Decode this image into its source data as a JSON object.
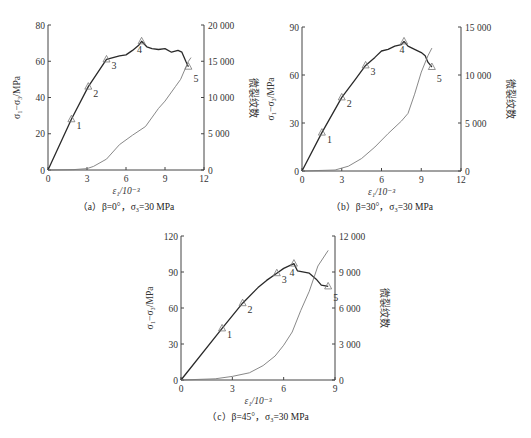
{
  "chart_data": [
    {
      "id": "a",
      "type": "line",
      "title": "(a) β=0°，σ3=30 MPa",
      "xlabel": "ε1/10⁻³",
      "ylabel": "σ1−σ3/MPa",
      "y2label": "微裂纹数",
      "xlim": [
        0,
        12
      ],
      "ylim": [
        0,
        80
      ],
      "y2lim": [
        0,
        20000
      ],
      "xticks": [
        "0",
        "3",
        "6",
        "9",
        "12"
      ],
      "yticks": [
        "0",
        "20",
        "40",
        "60",
        "80"
      ],
      "y2ticks": [
        "0",
        "5 000",
        "10 000",
        "15 000",
        "20 000"
      ],
      "grid": false,
      "series": [
        {
          "name": "stress",
          "axis": "left",
          "x": [
            0,
            1.8,
            3.1,
            4.5,
            5.0,
            5.5,
            6.0,
            6.5,
            7.0,
            7.2,
            7.6,
            8.0,
            8.5,
            9.0,
            9.5,
            10.0,
            10.3,
            10.6,
            10.8
          ],
          "y": [
            0,
            28,
            46,
            61,
            62,
            63,
            63.5,
            66,
            69,
            71,
            68,
            67,
            66.5,
            67,
            65,
            66,
            65,
            60,
            57
          ]
        },
        {
          "name": "micro-cracks",
          "axis": "right",
          "x": [
            0,
            2.0,
            3.0,
            3.5,
            4.5,
            5.5,
            6.5,
            7.5,
            8.5,
            9.0,
            9.8,
            10.2,
            10.8,
            11.0
          ],
          "y": [
            0,
            50,
            200,
            500,
            1500,
            3500,
            4800,
            6000,
            8500,
            9500,
            11500,
            12500,
            15000,
            15500
          ]
        }
      ],
      "points": [
        {
          "label": "1",
          "x": 1.8,
          "y": 28
        },
        {
          "label": "2",
          "x": 3.1,
          "y": 46
        },
        {
          "label": "3",
          "x": 4.5,
          "y": 61
        },
        {
          "label": "4",
          "x": 7.2,
          "y": 71
        },
        {
          "label": "5",
          "x": 10.8,
          "y": 57
        }
      ]
    },
    {
      "id": "b",
      "type": "line",
      "title": "(b) β=30°，σ3=30 MPa",
      "xlabel": "ε1/10⁻³",
      "ylabel": "σ1−σ3/MPa",
      "y2label": "微裂纹数",
      "xlim": [
        0,
        12
      ],
      "ylim": [
        0,
        90
      ],
      "y2lim": [
        0,
        15000
      ],
      "xticks": [
        "0",
        "3",
        "6",
        "9",
        "12"
      ],
      "yticks": [
        "0",
        "30",
        "60",
        "90"
      ],
      "y2ticks": [
        "0",
        "5 000",
        "10 000",
        "15 000"
      ],
      "grid": false,
      "series": [
        {
          "name": "stress",
          "axis": "left",
          "x": [
            0,
            1.5,
            3.0,
            4.0,
            4.8,
            5.5,
            6.0,
            6.5,
            7.0,
            7.5,
            7.7,
            8.0,
            8.5,
            9.0,
            9.3,
            9.5,
            9.8
          ],
          "y": [
            0,
            24,
            46,
            57,
            66,
            71,
            75,
            76,
            78,
            79,
            81,
            78,
            76,
            74,
            72,
            68,
            65
          ]
        },
        {
          "name": "micro-cracks",
          "axis": "right",
          "x": [
            0,
            2.5,
            3.5,
            4.5,
            5.5,
            6.5,
            7.5,
            8.0,
            8.5,
            9.0,
            9.5,
            9.8
          ],
          "y": [
            0,
            100,
            500,
            1300,
            2500,
            3900,
            5200,
            6000,
            8000,
            10300,
            12000,
            12800
          ]
        }
      ],
      "points": [
        {
          "label": "1",
          "x": 1.5,
          "y": 24
        },
        {
          "label": "2",
          "x": 3.0,
          "y": 46
        },
        {
          "label": "3",
          "x": 4.8,
          "y": 66
        },
        {
          "label": "4",
          "x": 7.7,
          "y": 81
        },
        {
          "label": "5",
          "x": 9.8,
          "y": 65
        }
      ]
    },
    {
      "id": "c",
      "type": "line",
      "title": "(c) β=45°，σ3=30 MPa",
      "xlabel": "ε1/10⁻³",
      "ylabel": "σ1−σ3/MPa",
      "y2label": "微裂纹数",
      "xlim": [
        0,
        9
      ],
      "ylim": [
        0,
        120
      ],
      "y2lim": [
        0,
        12000
      ],
      "xticks": [
        "0",
        "3",
        "6",
        "9"
      ],
      "yticks": [
        "0",
        "30",
        "60",
        "90",
        "120"
      ],
      "y2ticks": [
        "0",
        "3 000",
        "6 000",
        "9 000",
        "12 000"
      ],
      "grid": false,
      "series": [
        {
          "name": "stress",
          "axis": "left",
          "x": [
            0,
            2.4,
            3.6,
            4.5,
            5.0,
            5.6,
            6.0,
            6.6,
            6.8,
            7.5,
            7.9,
            8.2,
            8.6
          ],
          "y": [
            0,
            43,
            64,
            77,
            83,
            89,
            93,
            97,
            91,
            89,
            84,
            79,
            78
          ]
        },
        {
          "name": "micro-cracks",
          "axis": "right",
          "x": [
            0,
            2.0,
            3.0,
            4.0,
            4.8,
            5.5,
            6.0,
            6.5,
            7.0,
            7.5,
            8.0,
            8.6
          ],
          "y": [
            0,
            100,
            300,
            600,
            1200,
            2000,
            2900,
            4000,
            5800,
            7400,
            9500,
            10800
          ]
        }
      ],
      "points": [
        {
          "label": "1",
          "x": 2.4,
          "y": 43
        },
        {
          "label": "2",
          "x": 3.6,
          "y": 64
        },
        {
          "label": "3",
          "x": 5.6,
          "y": 89
        },
        {
          "label": "4",
          "x": 6.6,
          "y": 97
        },
        {
          "label": "5",
          "x": 8.6,
          "y": 78
        }
      ]
    }
  ],
  "captions": {
    "a": "（a）β=0°，σ₃=30 MPa",
    "b": "（b）β=30°，σ₃=30 MPa",
    "c": "（c）β=45°，σ₃=30 MPa"
  },
  "labels": {
    "xlabel": "ε₁/10⁻³",
    "ylabel": "σ₁−σ₃/MPa",
    "y2label": "微裂纹数"
  },
  "colors": {
    "stress": "#2a2a2a",
    "cracks": "#7a7a7a",
    "axis": "#444444"
  }
}
